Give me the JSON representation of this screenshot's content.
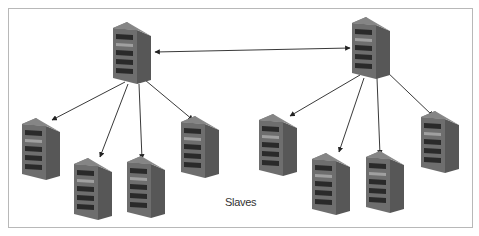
{
  "diagram": {
    "caption": "Slaves",
    "colors": {
      "server_front": "#6e6e6e",
      "server_side": "#5a5a5a",
      "server_top": "#8a8a8a",
      "slot": "#2a2a2a",
      "highlight": "#9a9a9a",
      "arrow": "#222222",
      "border": "#b8b8b8"
    },
    "nodes": [
      {
        "id": "master-left",
        "role": "master",
        "x": 113,
        "y": 22
      },
      {
        "id": "master-right",
        "role": "master",
        "x": 352,
        "y": 17
      },
      {
        "id": "slave-l1",
        "role": "slave",
        "x": 22,
        "y": 118
      },
      {
        "id": "slave-l2",
        "role": "slave",
        "x": 74,
        "y": 158
      },
      {
        "id": "slave-l3",
        "role": "slave",
        "x": 127,
        "y": 156
      },
      {
        "id": "slave-l4",
        "role": "slave",
        "x": 181,
        "y": 116
      },
      {
        "id": "slave-r1",
        "role": "slave",
        "x": 259,
        "y": 114
      },
      {
        "id": "slave-r2",
        "role": "slave",
        "x": 312,
        "y": 153
      },
      {
        "id": "slave-r3",
        "role": "slave",
        "x": 366,
        "y": 151
      },
      {
        "id": "slave-r4",
        "role": "slave",
        "x": 421,
        "y": 111
      }
    ],
    "edges": [
      {
        "from": "master-left",
        "to": "master-right",
        "type": "bidirectional"
      },
      {
        "from": "master-left",
        "to": "slave-l1"
      },
      {
        "from": "master-left",
        "to": "slave-l2"
      },
      {
        "from": "master-left",
        "to": "slave-l3"
      },
      {
        "from": "master-left",
        "to": "slave-l4"
      },
      {
        "from": "master-right",
        "to": "slave-r1"
      },
      {
        "from": "master-right",
        "to": "slave-r2"
      },
      {
        "from": "master-right",
        "to": "slave-r3"
      },
      {
        "from": "master-right",
        "to": "slave-r4"
      }
    ]
  }
}
